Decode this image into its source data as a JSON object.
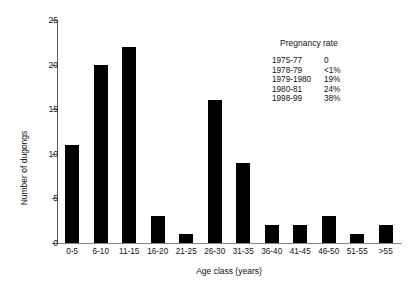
{
  "chart_data": {
    "type": "bar",
    "title": "",
    "categories": [
      "0-5",
      "6-10",
      "11-15",
      "16-20",
      "21-25",
      "26-30",
      "31-35",
      "36-40",
      "41-45",
      "46-50",
      "51-55",
      ">55"
    ],
    "values": [
      11,
      20,
      22,
      3,
      1,
      16,
      9,
      2,
      2,
      3,
      1,
      2
    ],
    "xlabel": "Age class (years)",
    "ylabel": "Number of dugongs",
    "ylim": [
      0,
      25
    ],
    "yticks": [
      0,
      5,
      10,
      15,
      20,
      25
    ],
    "ytick_labels": [
      "0",
      "5",
      "10",
      "15",
      "20",
      "25"
    ],
    "grid": false,
    "legend_position": "upper right",
    "bar_color": "#000000"
  },
  "legend": {
    "title": "Pregnancy rate",
    "rows": [
      {
        "years": "1975-77",
        "rate": "0"
      },
      {
        "years": "1978-79",
        "rate": "<1%"
      },
      {
        "years": "1979-1980",
        "rate": "19%"
      },
      {
        "years": "1980-81",
        "rate": "24%"
      },
      {
        "years": "1998-99",
        "rate": "38%"
      }
    ]
  }
}
